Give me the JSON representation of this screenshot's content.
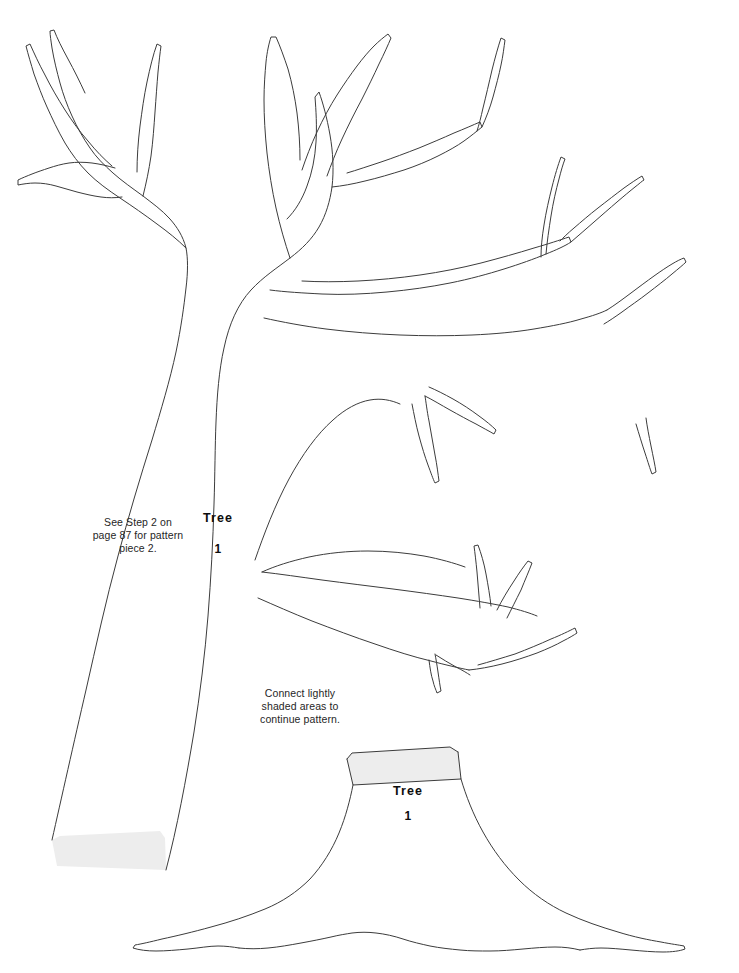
{
  "page": {
    "background_color": "#ffffff",
    "line_color": "#3c3c3c",
    "shaded_area_color": "#ededed"
  },
  "notes": [
    {
      "id": "step2",
      "text": "See Step 2 on\npage 87 for pattern\npiece 2."
    },
    {
      "id": "connect",
      "text": "Connect lightly\nshaded areas to\ncontinue pattern."
    }
  ],
  "pieces": [
    {
      "id": "piece-1-upper",
      "title": "Tree",
      "number": "1",
      "description": "Upper tree: trunk and branches"
    },
    {
      "id": "piece-1-lower",
      "title": "Tree",
      "number": "1",
      "description": "Lower tree: base and roots"
    }
  ]
}
